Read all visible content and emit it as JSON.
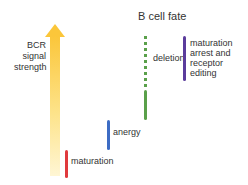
{
  "title": "B cell fate",
  "axis": {
    "label_lines": [
      "BCR",
      "signal",
      "strength"
    ],
    "arrow_color": "#fbc63a"
  },
  "fates": [
    {
      "label": "maturation",
      "color": "#e03a3e",
      "style": "solid"
    },
    {
      "label": "anergy",
      "color": "#3d6cc4",
      "style": "solid"
    },
    {
      "label": "deletion",
      "color": "#5aa04a",
      "style": "dotted-then-solid"
    },
    {
      "label_lines": [
        "maturation",
        "arrest and",
        "receptor",
        "editing"
      ],
      "color": "#5b3c9c",
      "style": "solid"
    }
  ]
}
